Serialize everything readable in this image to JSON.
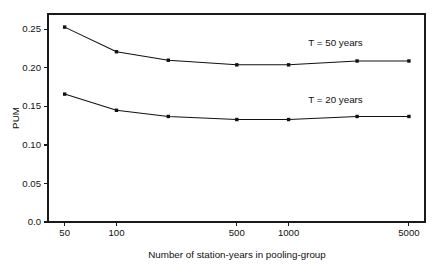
{
  "chart_data": {
    "type": "line",
    "title": "",
    "subtitle": "",
    "xlabel": "Number of station-years in pooling-group",
    "ylabel": "PUM",
    "xscale": "log",
    "yscale": "linear",
    "xlim": [
      40,
      6200
    ],
    "ylim": [
      0.0,
      0.27
    ],
    "grid": false,
    "legend_position": "inline-annotation",
    "x": [
      50,
      100,
      200,
      500,
      1000,
      2500,
      5000
    ],
    "xticks": [
      50,
      100,
      500,
      1000,
      5000
    ],
    "xticklabels": [
      "50",
      "100",
      "500",
      "1000",
      "5000"
    ],
    "yticks": [
      0.0,
      0.05,
      0.1,
      0.15,
      0.2,
      0.25
    ],
    "yticklabels": [
      "0.0",
      "0.05",
      "0.10",
      "0.15",
      "0.20",
      "0.25"
    ],
    "series": [
      {
        "name": "T = 50 years",
        "annotation": "T = 50 years",
        "marker": "filled-square",
        "color": "#111111",
        "values": [
          0.253,
          0.221,
          0.21,
          0.204,
          0.204,
          0.209,
          0.209
        ]
      },
      {
        "name": "T = 20 years",
        "annotation": "T = 20 years",
        "marker": "filled-square",
        "color": "#111111",
        "values": [
          0.166,
          0.145,
          0.137,
          0.133,
          0.133,
          0.137,
          0.137
        ]
      }
    ],
    "annotations": [
      {
        "text": "T = 50 years",
        "x": 1300,
        "y": 0.228
      },
      {
        "text": "T = 20 years",
        "x": 1300,
        "y": 0.155
      }
    ]
  },
  "figure": {
    "background": "#ffffff",
    "axis_color": "#1a1a1a",
    "line_color": "#111111"
  }
}
